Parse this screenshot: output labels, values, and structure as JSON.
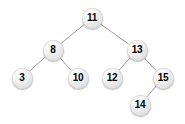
{
  "figure": {
    "kind": "binary-search-tree-diagram",
    "width": 185,
    "height": 124,
    "background_color": "#ffffff",
    "node_fill_color": "#e8e8e8",
    "node_text_color": "#000000",
    "edge_color": "#9a9a9a",
    "node_diameter": 21
  },
  "chart_data": {
    "type": "diagram",
    "title": "",
    "nodes": [
      {
        "id": "n11",
        "label": "11",
        "value": 11,
        "x": 92,
        "y": 18,
        "depth": 0
      },
      {
        "id": "n8",
        "label": "8",
        "value": 8,
        "x": 53,
        "y": 50,
        "depth": 1
      },
      {
        "id": "n13",
        "label": "13",
        "value": 13,
        "x": 137,
        "y": 50,
        "depth": 1
      },
      {
        "id": "n3",
        "label": "3",
        "value": 3,
        "x": 22,
        "y": 78,
        "depth": 2
      },
      {
        "id": "n10",
        "label": "10",
        "value": 10,
        "x": 78,
        "y": 78,
        "depth": 2
      },
      {
        "id": "n12",
        "label": "12",
        "value": 12,
        "x": 112,
        "y": 78,
        "depth": 2
      },
      {
        "id": "n15",
        "label": "15",
        "value": 15,
        "x": 163,
        "y": 78,
        "depth": 2
      },
      {
        "id": "n14",
        "label": "14",
        "value": 14,
        "x": 140,
        "y": 105,
        "depth": 3
      }
    ],
    "edges": [
      {
        "from": "n11",
        "to": "n8",
        "side": "left"
      },
      {
        "from": "n11",
        "to": "n13",
        "side": "right"
      },
      {
        "from": "n8",
        "to": "n3",
        "side": "left"
      },
      {
        "from": "n8",
        "to": "n10",
        "side": "right"
      },
      {
        "from": "n13",
        "to": "n12",
        "side": "left"
      },
      {
        "from": "n13",
        "to": "n15",
        "side": "right"
      },
      {
        "from": "n15",
        "to": "n14",
        "side": "left"
      }
    ]
  }
}
